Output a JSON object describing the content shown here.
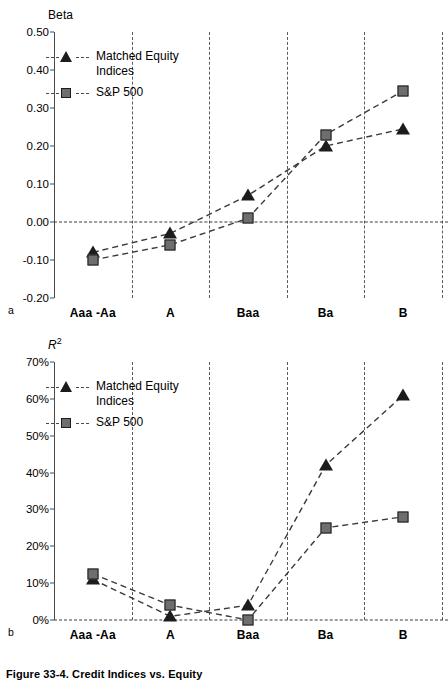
{
  "caption": "Figure 33-4.  Credit Indices vs. Equity",
  "panel_a": {
    "letter": "a",
    "axis_title": "Beta",
    "yticks": [
      "0.50",
      "0.40",
      "0.30",
      "0.20",
      "0.10",
      "0.00",
      "-0.10",
      "-0.20"
    ],
    "xlabels": [
      "Aaa -Aa",
      "A",
      "Baa",
      "Ba",
      "B"
    ],
    "legend": [
      {
        "name": "matched-equity-indices",
        "line1": "Matched Equity",
        "line2": "Indices",
        "marker": "triangle"
      },
      {
        "name": "sp-500",
        "line1": "S&P 500",
        "line2": "",
        "marker": "square"
      }
    ]
  },
  "panel_b": {
    "letter": "b",
    "axis_title": "R",
    "axis_title_sup": "2",
    "yticks": [
      "70%",
      "60%",
      "50%",
      "40%",
      "30%",
      "20%",
      "10%",
      "0%"
    ],
    "xlabels": [
      "Aaa -Aa",
      "A",
      "Baa",
      "Ba",
      "B"
    ],
    "legend": [
      {
        "name": "matched-equity-indices",
        "line1": "Matched Equity",
        "line2": "Indices",
        "marker": "triangle"
      },
      {
        "name": "sp-500",
        "line1": "S&P 500",
        "line2": "",
        "marker": "square"
      }
    ]
  },
  "colors": {
    "marker_fill": "#6e6e6e",
    "marker_edge": "#1c1c1c",
    "triangle_fill": "#1c1c1c",
    "grid": "#5b5b5b",
    "axis": "#4a4a4a"
  },
  "chart_data": [
    {
      "type": "line",
      "panel": "a",
      "title": "Beta",
      "xlabel": "",
      "ylabel": "Beta",
      "categories": [
        "Aaa -Aa",
        "A",
        "Baa",
        "Ba",
        "B"
      ],
      "ylim": [
        -0.2,
        0.5
      ],
      "ytick_values": [
        0.5,
        0.4,
        0.3,
        0.2,
        0.1,
        0.0,
        -0.1,
        -0.2
      ],
      "grid": "vertical dashed at each category, horizontal dashed at 0.00",
      "legend_position": "upper-left inside plot",
      "series": [
        {
          "name": "Matched Equity Indices",
          "marker": "triangle",
          "values": [
            -0.08,
            -0.03,
            0.07,
            0.2,
            0.245
          ]
        },
        {
          "name": "S&P 500",
          "marker": "square",
          "values": [
            -0.1,
            -0.06,
            0.01,
            0.23,
            0.345
          ]
        }
      ]
    },
    {
      "type": "line",
      "panel": "b",
      "title": "R2",
      "xlabel": "",
      "ylabel": "R2",
      "categories": [
        "Aaa -Aa",
        "A",
        "Baa",
        "Ba",
        "B"
      ],
      "ylim": [
        0,
        70
      ],
      "ytick_values": [
        70,
        60,
        50,
        40,
        30,
        20,
        10,
        0
      ],
      "unit": "%",
      "grid": "vertical dashed at each category, horizontal dashed at 0%",
      "legend_position": "upper-left inside plot",
      "series": [
        {
          "name": "Matched Equity Indices",
          "marker": "triangle",
          "values": [
            11,
            1,
            4,
            42,
            61
          ]
        },
        {
          "name": "S&P 500",
          "marker": "square",
          "values": [
            12.5,
            4,
            0,
            25,
            28
          ]
        }
      ]
    }
  ]
}
